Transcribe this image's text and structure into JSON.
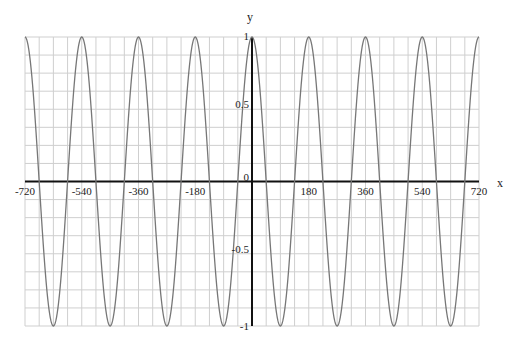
{
  "chart_data": {
    "type": "line",
    "title": "",
    "xlabel": "x",
    "ylabel": "y",
    "xlim": [
      -720,
      720
    ],
    "ylim": [
      -1,
      1
    ],
    "grid": true,
    "x_ticks": [
      -720,
      -540,
      -360,
      -180,
      0,
      180,
      360,
      540,
      720
    ],
    "x_tick_labels": [
      "-720",
      "-540",
      "-360",
      "-180",
      "0",
      "180",
      "360",
      "540",
      "720"
    ],
    "y_ticks": [
      1,
      0.5,
      0,
      -0.5,
      -1
    ],
    "y_tick_labels": [
      "1",
      "0.5",
      "0",
      "-0.5",
      "-1"
    ],
    "x_grid_step": 45,
    "y_grid_step": 0.125,
    "series": [
      {
        "name": "y = cos(2x)",
        "function": "cos(2x) with x in degrees",
        "x": [
          -720,
          -675,
          -630,
          -585,
          -540,
          -495,
          -450,
          -405,
          -360,
          -315,
          -270,
          -225,
          -180,
          -135,
          -90,
          -45,
          0,
          45,
          90,
          135,
          180,
          225,
          270,
          315,
          360,
          405,
          450,
          495,
          540,
          585,
          630,
          675,
          720
        ],
        "values": [
          1,
          0,
          -1,
          0,
          1,
          0,
          -1,
          0,
          1,
          0,
          -1,
          0,
          1,
          0,
          -1,
          0,
          1,
          0,
          -1,
          0,
          1,
          0,
          -1,
          0,
          1,
          0,
          -1,
          0,
          1,
          0,
          -1,
          0,
          1
        ],
        "color": "#777777"
      }
    ],
    "legend": null
  },
  "labels": {
    "x_axis": "x",
    "y_axis": "y"
  }
}
